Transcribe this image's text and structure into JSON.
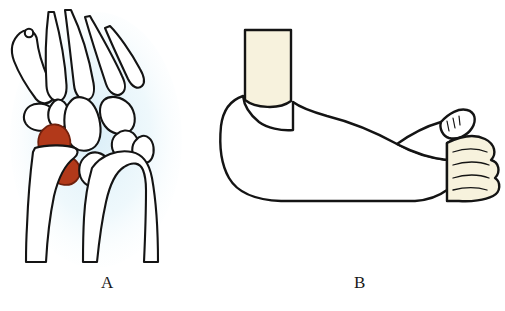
{
  "figure": {
    "background_color": "#ffffff",
    "width": 505,
    "height": 311
  },
  "panels": [
    {
      "id": "panel-a",
      "label": "A",
      "caption": "Wrist radiograph line drawing with highlighted carpal bones",
      "halo_color": "#e8f4fa",
      "outline_color": "#141414",
      "bone_fill": "#ffffff",
      "highlight_color": "#b2391a",
      "highlight_stroke": "#7a2410",
      "structures": [
        "thumb-metacarpal",
        "sesamoid-bone",
        "index-metacarpal",
        "middle-metacarpal",
        "ring-metacarpal",
        "little-metacarpal",
        "trapezium",
        "trapezoid",
        "capitate",
        "hamate",
        "scaphoid",
        "lunate",
        "triquetrum",
        "pisiform",
        "radius",
        "ulna"
      ],
      "highlighted_structures": [
        "scaphoid",
        "lunate"
      ]
    },
    {
      "id": "panel-b",
      "label": "B",
      "caption": "Thumb spica cast applied to forearm and hand",
      "skin_color": "#f7f2dd",
      "cast_color": "#ffffff",
      "outline_color": "#141414",
      "structures": [
        "upper-arm-skin",
        "cast-body",
        "elbow-curve",
        "thumb-cast-extension",
        "exposed-thumb-tip",
        "exposed-fingers"
      ]
    }
  ]
}
